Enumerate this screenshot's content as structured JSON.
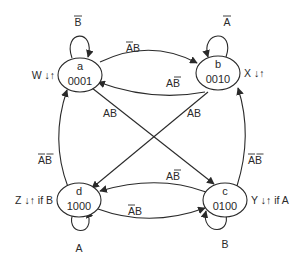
{
  "diagram": {
    "type": "state-machine",
    "states": [
      {
        "id": "a",
        "name": "a",
        "code": "0001",
        "output": "W ↓↑",
        "self_loop": "B̄",
        "self_loop_parts": [
          {
            "t": "B",
            "bar": true
          }
        ]
      },
      {
        "id": "b",
        "name": "b",
        "code": "0010",
        "output": "X ↓↑",
        "self_loop": "Ā",
        "self_loop_parts": [
          {
            "t": "A",
            "bar": true
          }
        ]
      },
      {
        "id": "c",
        "name": "c",
        "code": "0100",
        "output": "Y ↓↑ if A",
        "self_loop": "B",
        "self_loop_parts": [
          {
            "t": "B",
            "bar": false
          }
        ]
      },
      {
        "id": "d",
        "name": "d",
        "code": "1000",
        "output": "Z ↓↑ if B",
        "self_loop": "A",
        "self_loop_parts": [
          {
            "t": "A",
            "bar": false
          }
        ]
      }
    ],
    "transitions": [
      {
        "from": "a",
        "to": "b",
        "label": "ĀB"
      },
      {
        "from": "b",
        "to": "a",
        "label": "AB̄"
      },
      {
        "from": "a",
        "to": "c",
        "label": "AB"
      },
      {
        "from": "b",
        "to": "d",
        "label": "AB"
      },
      {
        "from": "c",
        "to": "d",
        "label": "AB̄"
      },
      {
        "from": "d",
        "to": "c",
        "label": "ĀB"
      },
      {
        "from": "d",
        "to": "a",
        "label": "ĀB̄"
      },
      {
        "from": "c",
        "to": "b",
        "label": "ĀB̄"
      }
    ],
    "label_text": {
      "A": "A",
      "B": "B",
      "AB": "AB"
    }
  }
}
